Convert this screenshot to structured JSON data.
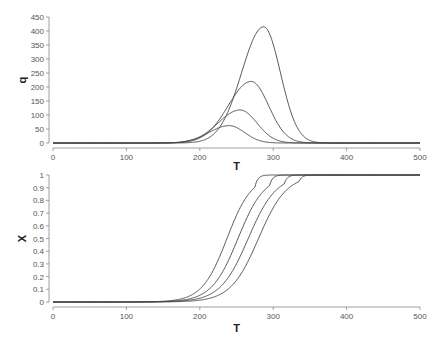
{
  "chart_data": [
    {
      "type": "line",
      "title": "",
      "xlabel": "T",
      "ylabel": "q",
      "xlim": [
        0,
        500
      ],
      "ylim": [
        0,
        450
      ],
      "xticks": [
        0,
        100,
        200,
        300,
        400,
        500
      ],
      "yticks": [
        0,
        50,
        100,
        150,
        200,
        250,
        300,
        350,
        400,
        450
      ],
      "grid": false,
      "legend": "none",
      "series": [
        {
          "name": "curve-1",
          "peak_T": 240,
          "peak_value": 62,
          "width": 22
        },
        {
          "name": "curve-2",
          "peak_T": 255,
          "peak_value": 118,
          "width": 24
        },
        {
          "name": "curve-3",
          "peak_T": 270,
          "peak_value": 220,
          "width": 25
        },
        {
          "name": "curve-4",
          "peak_T": 287,
          "peak_value": 415,
          "width": 24
        }
      ]
    },
    {
      "type": "line",
      "title": "",
      "xlabel": "T",
      "ylabel": "X",
      "xlim": [
        0,
        500
      ],
      "ylim": [
        0,
        1
      ],
      "xticks": [
        0,
        100,
        200,
        300,
        400,
        500
      ],
      "yticks": [
        0,
        0.1,
        0.2,
        0.3,
        0.4,
        0.5,
        0.6,
        0.7,
        0.8,
        0.9,
        1
      ],
      "grid": false,
      "legend": "none",
      "series": [
        {
          "name": "curve-1",
          "midpoint_T": 237,
          "steepness": 17,
          "saturation_T": 275
        },
        {
          "name": "curve-2",
          "midpoint_T": 252,
          "steepness": 18,
          "saturation_T": 295
        },
        {
          "name": "curve-3",
          "midpoint_T": 266,
          "steepness": 19,
          "saturation_T": 315
        },
        {
          "name": "curve-4",
          "midpoint_T": 280,
          "steepness": 19,
          "saturation_T": 335
        }
      ]
    }
  ]
}
